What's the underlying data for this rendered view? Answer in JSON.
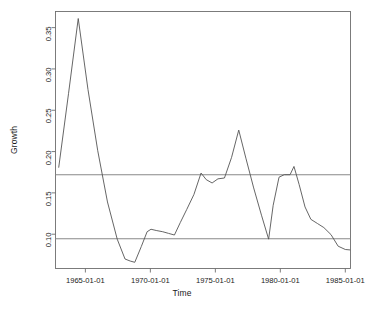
{
  "chart_data": {
    "type": "line",
    "title": "",
    "xlabel": "Time",
    "ylabel": "Growth",
    "grid": false,
    "legend": null,
    "xtick_labels": [
      "1965-01-01",
      "1970-01-01",
      "1975-01-01",
      "1980-01-01",
      "1985-01-01"
    ],
    "xtick_values": [
      1965.0,
      1970.0,
      1975.0,
      1980.0,
      1985.0
    ],
    "ytick_labels": [
      "0.10",
      "0.15",
      "0.20",
      "0.25",
      "0.30",
      "0.35"
    ],
    "ytick_values": [
      0.1,
      0.15,
      0.2,
      0.25,
      0.3,
      0.35
    ],
    "xlim": [
      1962.7,
      1985.4
    ],
    "ylim": [
      0.0585,
      0.3695
    ],
    "series": [
      {
        "name": "Growth",
        "color": "#555555",
        "x": [
          1962.95,
          1963.7,
          1964.45,
          1965.2,
          1965.95,
          1966.7,
          1967.45,
          1968.05,
          1968.45,
          1968.8,
          1969.3,
          1969.75,
          1970.05,
          1970.45,
          1970.95,
          1971.4,
          1971.85,
          1972.3,
          1972.8,
          1973.35,
          1973.9,
          1974.3,
          1974.75,
          1975.2,
          1975.7,
          1976.25,
          1976.8,
          1977.35,
          1977.95,
          1978.55,
          1979.1,
          1979.45,
          1979.9,
          1980.3,
          1980.75,
          1981.05,
          1981.45,
          1981.9,
          1982.35,
          1982.85,
          1983.35,
          1983.9,
          1984.45,
          1985.0,
          1985.35
        ],
        "y": [
          0.181,
          0.27,
          0.361,
          0.275,
          0.201,
          0.139,
          0.094,
          0.07,
          0.0675,
          0.066,
          0.085,
          0.103,
          0.106,
          0.1045,
          0.103,
          0.101,
          0.099,
          0.114,
          0.13,
          0.148,
          0.174,
          0.166,
          0.162,
          0.167,
          0.168,
          0.193,
          0.226,
          0.192,
          0.156,
          0.123,
          0.094,
          0.135,
          0.169,
          0.172,
          0.172,
          0.182,
          0.16,
          0.133,
          0.118,
          0.113,
          0.108,
          0.0995,
          0.0855,
          0.0815,
          0.081
        ]
      }
    ],
    "reference_lines": [
      {
        "name": "upper-control-limit",
        "orientation": "horizontal",
        "value": 0.172,
        "color": "#888888"
      },
      {
        "name": "lower-control-limit",
        "orientation": "horizontal",
        "value": 0.0945,
        "color": "#888888"
      }
    ]
  },
  "caption": ""
}
